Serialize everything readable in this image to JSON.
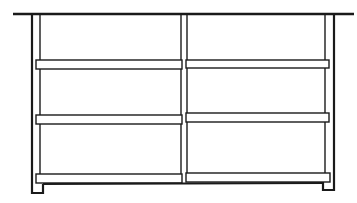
{
  "diagram": {
    "stroke_color": "#1a1a1a",
    "background": "#ffffff",
    "columns": 2,
    "shelves": 3
  }
}
